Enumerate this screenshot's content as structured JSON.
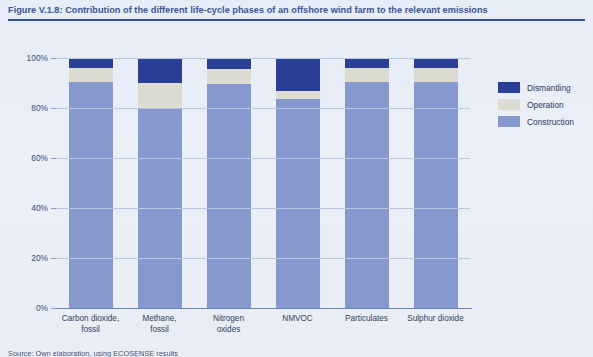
{
  "figure": {
    "title": "Figure V.1.8: Contribution of the different life-cycle phases of an offshore wind farm to the relevant emissions",
    "source_note": "Source: Own elaboration, using ECOSENSE results"
  },
  "colors": {
    "dismantling": "#2a3f95",
    "operation": "#dcdcd2",
    "construction": "#8698ce",
    "background": "#e9eef7",
    "title": "#3c5496",
    "rule": "#35508f",
    "gridline": "#b9c6e0",
    "axis": "#6e83b5"
  },
  "legend": {
    "position": "right",
    "items": [
      {
        "label": "Dismantling",
        "color": "#2a3f95",
        "key": "dismantling"
      },
      {
        "label": "Operation",
        "color": "#dcdcd2",
        "key": "operation"
      },
      {
        "label": "Construction",
        "color": "#8698ce",
        "key": "construction"
      }
    ]
  },
  "axes": {
    "y_ticks": [
      "0%",
      "20%",
      "40%",
      "60%",
      "80%",
      "100%"
    ],
    "y_values": [
      0,
      20,
      40,
      60,
      80,
      100
    ],
    "ylim": [
      0,
      100
    ],
    "ylabel": "",
    "xlabel": "",
    "grid": true
  },
  "chart_data": {
    "type": "bar",
    "subtype": "stacked-percentage",
    "title": "Figure V.1.8: Contribution of the different life-cycle phases of an offshore wind farm to the relevant emissions",
    "xlabel": "",
    "ylabel": "",
    "ylim": [
      0,
      100
    ],
    "ytick_labels": [
      "0%",
      "20%",
      "40%",
      "60%",
      "80%",
      "100%"
    ],
    "grid": true,
    "legend_position": "right",
    "categories": [
      "Carbon dioxide,\nfossil",
      "Methane,\nfossil",
      "Nitrogen\noxides",
      "NMVOC",
      "Particulates",
      "Sulphur dioxide"
    ],
    "series": [
      {
        "name": "Construction",
        "color": "#8698ce",
        "values": [
          90.5,
          79.5,
          89.5,
          83.5,
          90.5,
          90.5
        ]
      },
      {
        "name": "Operation",
        "color": "#dcdcd2",
        "values": [
          5.5,
          10.5,
          6.0,
          3.5,
          5.5,
          5.5
        ]
      },
      {
        "name": "Dismantling",
        "color": "#2a3f95",
        "values": [
          4.0,
          10.0,
          4.5,
          13.0,
          4.0,
          4.0
        ]
      }
    ]
  }
}
